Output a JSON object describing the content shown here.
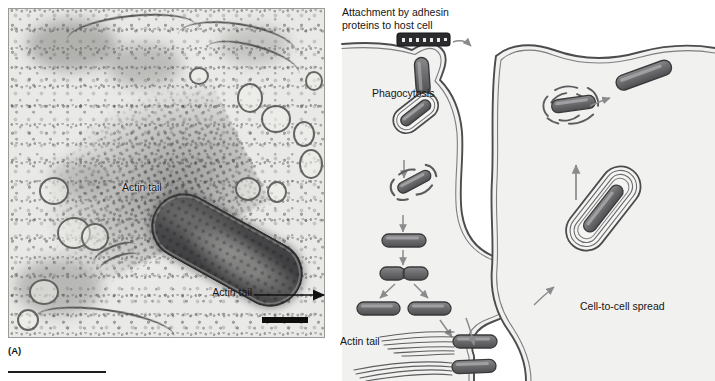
{
  "figure": {
    "panels": [
      {
        "id": "A",
        "letter_label": "(A)",
        "type": "electron-micrograph",
        "annotations": [
          {
            "name": "actin-tail",
            "text": "Actin tail"
          }
        ],
        "scale_bar": {
          "present": true,
          "label": ""
        }
      },
      {
        "id": "B",
        "letter_label": "(B)",
        "type": "schematic-diagram",
        "labels": {
          "attachment_line1": "Attachment by adhesin",
          "attachment_line2": "proteins to host cell",
          "phagocytosis": "Phagocytosis",
          "actin_tail": "Actin tail",
          "cell_to_cell_spread": "Cell-to-cell spread"
        }
      }
    ]
  },
  "colors": {
    "bacterium_fill": "#6e6e70",
    "bacterium_stroke": "#3a3a3c",
    "membrane_stroke": "#4c4c4e",
    "cytoplasm_fill": "#f1f1ef",
    "arrow_gray": "#8b8b8d",
    "arrow_black": "#111111",
    "adhesin_dark": "#2b2b2d",
    "text": "#151515",
    "micrograph_base": "#e9e9e7"
  },
  "diagram_steps": [
    {
      "order": 1,
      "name": "adhesin-attachment",
      "description": "Bacterium attaches to host cell surface via adhesin proteins"
    },
    {
      "order": 2,
      "name": "phagocytosis-uptake",
      "description": "Host membrane invaginates and engulfs the bacterium"
    },
    {
      "order": 3,
      "name": "vacuole-enclosed",
      "description": "Bacterium enclosed in a phagocytic vacuole"
    },
    {
      "order": 4,
      "name": "vacuole-escape",
      "description": "Bacterium lyses the vacuole membrane and escapes into cytosol"
    },
    {
      "order": 5,
      "name": "cytosolic-replication",
      "description": "Free bacterium in cytosol begins to divide"
    },
    {
      "order": 6,
      "name": "binary-fission",
      "description": "Bacterium divides into two daughter cells"
    },
    {
      "order": 7,
      "name": "actin-tail-motility",
      "description": "Daughter bacteria nucleate actin comet tails and move through cytosol"
    },
    {
      "order": 8,
      "name": "membrane-protrusion",
      "description": "Motile bacterium pushes a protrusion into the neighbouring cell"
    },
    {
      "order": 9,
      "name": "double-membrane-vacuole",
      "description": "Bacterium is taken into the adjacent cell inside a double-membrane vacuole"
    },
    {
      "order": 10,
      "name": "second-cell-escape",
      "description": "Bacterium escapes the double membrane into the new host cytosol"
    }
  ]
}
